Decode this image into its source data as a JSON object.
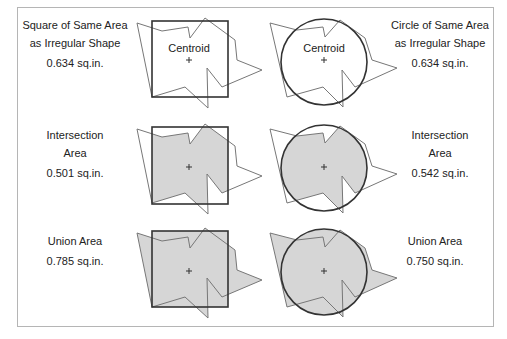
{
  "colors": {
    "frame": "#b5b5b5",
    "outline": "#333333",
    "polygon_stroke": "#666666",
    "fill": "#d6d6d6",
    "text": "#222222"
  },
  "rows": [
    {
      "left": {
        "line1": "Square of Same Area",
        "line2": "as Irregular Shape",
        "value": "0.634 sq.in."
      },
      "right": {
        "line1": "Circle of Same Area",
        "line2": "as Irregular Shape",
        "value": "0.634 sq.in."
      },
      "centroid_label": "Centroid",
      "fill_mode": "none"
    },
    {
      "left": {
        "line1": "Intersection",
        "line2": "Area",
        "value": "0.501 sq.in."
      },
      "right": {
        "line1": "Intersection",
        "line2": "Area",
        "value": "0.542 sq.in."
      },
      "fill_mode": "intersection"
    },
    {
      "left": {
        "line1": "Union Area",
        "value": "0.785 sq.in."
      },
      "right": {
        "line1": "Union Area",
        "value": "0.750 sq.in."
      },
      "fill_mode": "union"
    }
  ],
  "centroid_marker": "+"
}
